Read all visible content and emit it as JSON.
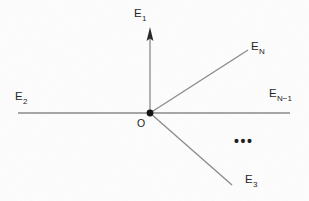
{
  "figure": {
    "background_color": "#fdfdfd",
    "line_color": "#8a8a8a",
    "text_color": "#262626",
    "origin": {
      "label": "O",
      "x": 150,
      "y": 113,
      "dot_radius": 3.4
    },
    "rays": [
      {
        "id": "E1",
        "label": "E",
        "subscript": "1",
        "has_arrow": true,
        "from": [
          150,
          113
        ],
        "to": [
          150,
          28
        ],
        "label_x": 134,
        "label_y": 17
      },
      {
        "id": "E2",
        "label": "E",
        "subscript": "2",
        "has_arrow": false,
        "from": [
          150,
          113
        ],
        "to": [
          18,
          113
        ],
        "label_x": 15,
        "label_y": 100
      },
      {
        "id": "E3",
        "label": "E",
        "subscript": "3",
        "has_arrow": false,
        "from": [
          150,
          113
        ],
        "to": [
          232,
          185
        ],
        "label_x": 245,
        "label_y": 183
      },
      {
        "id": "EN",
        "label": "E",
        "subscript": "N",
        "has_arrow": false,
        "from": [
          150,
          113
        ],
        "to": [
          248,
          50
        ],
        "label_x": 251,
        "label_y": 50
      },
      {
        "id": "ENminus1",
        "label": "E",
        "subscript": "N−1",
        "has_arrow": false,
        "from": [
          150,
          113
        ],
        "to": [
          290,
          113
        ],
        "label_x": 269,
        "label_y": 97
      }
    ],
    "ellipsis": {
      "text": "•••",
      "x": 234,
      "y": 146
    }
  }
}
